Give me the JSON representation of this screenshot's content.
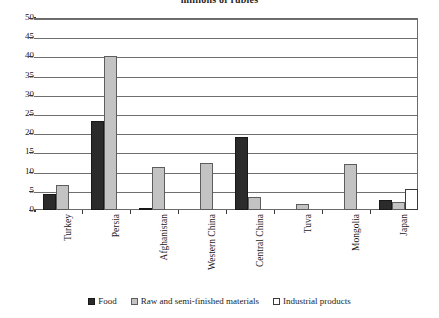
{
  "chart_data": {
    "type": "bar",
    "title": "millions of rubles",
    "xlabel": "",
    "ylabel": "",
    "ylim": [
      0,
      50
    ],
    "ytick_step": 5,
    "yticks": [
      "50",
      "45",
      "40",
      "35",
      "30",
      "25",
      "20",
      "15",
      "10",
      "5",
      "0"
    ],
    "grid": true,
    "legend_position": "bottom",
    "categories": [
      "Turkey",
      "Persia",
      "Afghanistan",
      "Western China",
      "Central China",
      "Tuva",
      "Mongolia",
      "Japan"
    ],
    "series": [
      {
        "name": "Food",
        "color": "#2b2b2b",
        "values": [
          4.2,
          23.2,
          0.3,
          0.0,
          19.0,
          0.0,
          0.0,
          2.5
        ]
      },
      {
        "name": "Raw  and semi-finished materials",
        "color": "#c3c3c3",
        "values": [
          6.5,
          40.0,
          11.2,
          12.3,
          3.5,
          1.5,
          12.0,
          2.0
        ]
      },
      {
        "name": "Industrial products",
        "color": "#ffffff",
        "values": [
          0.0,
          0.0,
          0.0,
          0.0,
          0.0,
          0.0,
          0.0,
          5.5
        ]
      }
    ]
  },
  "legend": {
    "items": [
      {
        "label": "Food",
        "swatch": "food"
      },
      {
        "label": "Raw  and semi-finished materials",
        "swatch": "raw"
      },
      {
        "label": "Industrial products",
        "swatch": "industrial"
      }
    ]
  }
}
